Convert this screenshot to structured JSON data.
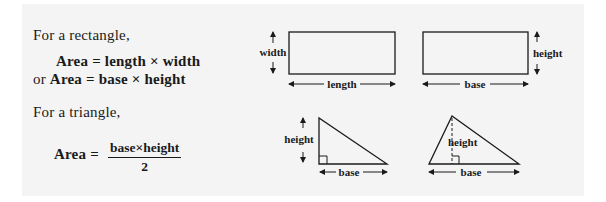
{
  "rectangle": {
    "intro": "For a  rectangle,",
    "formula1": {
      "prefix": "",
      "lhs": "Area",
      "eq": "=",
      "rhs": "length × width"
    },
    "formula2": {
      "prefix": "or",
      "lhs": "Area",
      "eq": "=",
      "rhs": "base × height"
    },
    "diagram1": {
      "side_label": "width",
      "bottom_label": "length"
    },
    "diagram2": {
      "side_label": "height",
      "bottom_label": "base"
    }
  },
  "triangle": {
    "intro": "For a  triangle,",
    "formula": {
      "lhs": "Area",
      "eq": "=",
      "numerator": "base×height",
      "denominator": "2"
    },
    "diagram1": {
      "side_label": "height",
      "bottom_label": "base",
      "marker": "right-angle"
    },
    "diagram2": {
      "inner_label": "height",
      "bottom_label": "base",
      "marker": "right-angle"
    }
  },
  "colors": {
    "ink": "#1a1a1a",
    "panel": "#f4f4f4",
    "page": "#ffffff"
  }
}
